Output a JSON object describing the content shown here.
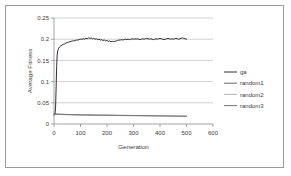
{
  "chart_data": {
    "type": "line",
    "title": "",
    "xlabel": "Generation",
    "ylabel": "Average Fitness",
    "xlim": [
      0,
      600
    ],
    "ylim": [
      0,
      0.25
    ],
    "xticks": [
      "0",
      "100",
      "200",
      "300",
      "400",
      "500",
      "600"
    ],
    "yticks": [
      "0",
      "0.05",
      "0.1",
      "0.15",
      "0.2",
      "0.25"
    ],
    "xtick_values": [
      0,
      100,
      200,
      300,
      400,
      500,
      600
    ],
    "ytick_values": [
      0,
      0.05,
      0.1,
      0.15,
      0.2,
      0.25
    ],
    "grid": "horizontal",
    "legend_position": "right",
    "x_data_range": [
      0,
      500
    ],
    "series": [
      {
        "name": "ga",
        "color": "#1a1a1a",
        "x": [
          0,
          2,
          4,
          6,
          8,
          10,
          12,
          14,
          16,
          18,
          20,
          25,
          30,
          35,
          40,
          45,
          50,
          55,
          60,
          65,
          70,
          75,
          80,
          85,
          90,
          95,
          100,
          105,
          110,
          115,
          120,
          125,
          130,
          135,
          140,
          145,
          150,
          155,
          160,
          165,
          170,
          175,
          180,
          185,
          190,
          195,
          200,
          205,
          210,
          215,
          220,
          225,
          230,
          235,
          240,
          245,
          250,
          255,
          260,
          265,
          270,
          275,
          280,
          285,
          290,
          295,
          300,
          305,
          310,
          315,
          320,
          325,
          330,
          335,
          340,
          345,
          350,
          355,
          360,
          365,
          370,
          375,
          380,
          385,
          390,
          395,
          400,
          405,
          410,
          415,
          420,
          425,
          430,
          435,
          440,
          445,
          450,
          455,
          460,
          465,
          470,
          475,
          480,
          485,
          490,
          495,
          500
        ],
        "values": [
          0.021,
          0.022,
          0.024,
          0.04,
          0.085,
          0.135,
          0.163,
          0.172,
          0.176,
          0.179,
          0.181,
          0.184,
          0.186,
          0.188,
          0.189,
          0.191,
          0.192,
          0.193,
          0.194,
          0.195,
          0.196,
          0.196,
          0.197,
          0.198,
          0.198,
          0.199,
          0.2,
          0.2,
          0.201,
          0.2,
          0.202,
          0.201,
          0.203,
          0.202,
          0.203,
          0.201,
          0.202,
          0.2,
          0.201,
          0.199,
          0.2,
          0.198,
          0.199,
          0.197,
          0.198,
          0.196,
          0.197,
          0.195,
          0.196,
          0.194,
          0.195,
          0.194,
          0.195,
          0.196,
          0.197,
          0.198,
          0.198,
          0.199,
          0.198,
          0.199,
          0.2,
          0.199,
          0.2,
          0.199,
          0.2,
          0.201,
          0.2,
          0.201,
          0.2,
          0.201,
          0.2,
          0.199,
          0.2,
          0.201,
          0.2,
          0.201,
          0.202,
          0.201,
          0.2,
          0.201,
          0.2,
          0.199,
          0.2,
          0.201,
          0.2,
          0.201,
          0.202,
          0.201,
          0.2,
          0.199,
          0.2,
          0.201,
          0.202,
          0.201,
          0.2,
          0.201,
          0.2,
          0.201,
          0.202,
          0.201,
          0.2,
          0.201,
          0.202,
          0.203,
          0.202,
          0.201,
          0.2
        ]
      },
      {
        "name": "random1",
        "color": "#555555",
        "x": [
          0,
          25,
          50,
          75,
          100,
          125,
          150,
          175,
          200,
          225,
          250,
          275,
          300,
          325,
          350,
          375,
          400,
          425,
          450,
          475,
          500
        ],
        "values": [
          0.0235,
          0.0228,
          0.0222,
          0.0219,
          0.0216,
          0.0213,
          0.0211,
          0.0209,
          0.0207,
          0.0205,
          0.0203,
          0.0201,
          0.0199,
          0.0197,
          0.0195,
          0.0193,
          0.0191,
          0.0189,
          0.0187,
          0.0185,
          0.0183
        ]
      },
      {
        "name": "random2",
        "color": "#777777",
        "x": [
          0,
          25,
          50,
          75,
          100,
          125,
          150,
          175,
          200,
          225,
          250,
          275,
          300,
          325,
          350,
          375,
          400,
          425,
          450,
          475,
          500
        ],
        "values": [
          0.0228,
          0.0222,
          0.0217,
          0.0214,
          0.0211,
          0.0209,
          0.0207,
          0.0205,
          0.0203,
          0.0201,
          0.0199,
          0.0197,
          0.0196,
          0.0194,
          0.0192,
          0.019,
          0.0188,
          0.0186,
          0.0184,
          0.0182,
          0.018
        ]
      },
      {
        "name": "random3",
        "color": "#666666",
        "x": [
          0,
          25,
          50,
          75,
          100,
          125,
          150,
          175,
          200,
          225,
          250,
          275,
          300,
          325,
          350,
          375,
          400,
          425,
          450,
          475,
          500
        ],
        "values": [
          0.0242,
          0.0233,
          0.0226,
          0.0222,
          0.0219,
          0.0216,
          0.0214,
          0.0212,
          0.021,
          0.0208,
          0.0206,
          0.0204,
          0.0202,
          0.02,
          0.0198,
          0.0196,
          0.0194,
          0.0192,
          0.019,
          0.0188,
          0.0186
        ]
      }
    ],
    "legend": [
      {
        "label": "ga",
        "color": "#1a1a1a"
      },
      {
        "label": "random1",
        "color": "#555555"
      },
      {
        "label": "random2",
        "color": "#aaaaaa"
      },
      {
        "label": "random3",
        "color": "#666666"
      }
    ]
  },
  "colors": {
    "border": "#9a9a9a",
    "gridline": "#b3b3b3",
    "axis": "#808080",
    "text": "#3a3a3a",
    "background": "#ffffff"
  }
}
